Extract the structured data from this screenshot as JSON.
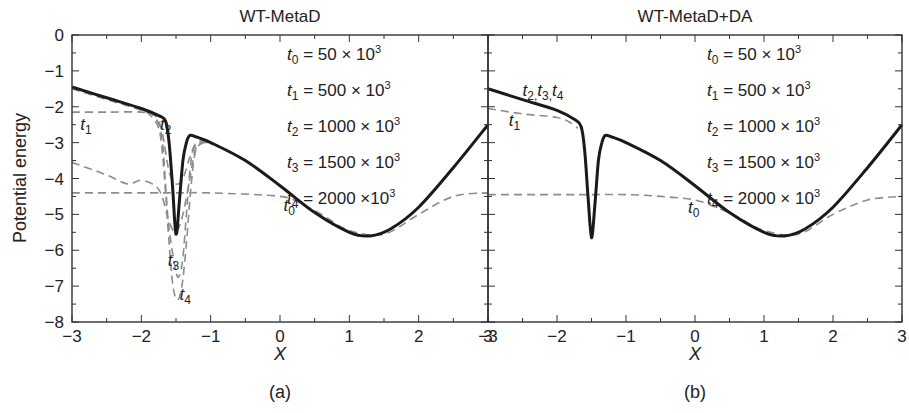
{
  "chart_data": [
    {
      "type": "line",
      "panel_label": "(a)",
      "title": "WT-MetaD",
      "xlabel": "X",
      "ylabel": "Potential energy",
      "xlim": [
        -3,
        3
      ],
      "ylim": [
        -8,
        0
      ],
      "xticks": [
        -3,
        -2,
        -1,
        0,
        1,
        2,
        3
      ],
      "yticks": [
        0,
        -1,
        -2,
        -3,
        -4,
        -5,
        -6,
        -7,
        -8
      ],
      "grid": false,
      "legend_text": [
        {
          "var": "t",
          "sub": "0",
          "expr": "= 50 × 10",
          "sup": "3"
        },
        {
          "var": "t",
          "sub": "1",
          "expr": "= 500 × 10",
          "sup": "3"
        },
        {
          "var": "t",
          "sub": "2",
          "expr": "= 1000 × 10",
          "sup": "3"
        },
        {
          "var": "t",
          "sub": "3",
          "expr": "= 1500 × 10",
          "sup": "3"
        },
        {
          "var": "t",
          "sub": "4",
          "expr": "= 2000 ×10",
          "sup": "3"
        }
      ],
      "series": [
        {
          "name": "true potential",
          "style": "solid",
          "color": "#1a1a1a",
          "x": [
            -3,
            -2.5,
            -2,
            -1.75,
            -1.65,
            -1.6,
            -1.55,
            -1.5,
            -1.45,
            -1.4,
            -1.35,
            -1.3,
            -1.2,
            -1.0,
            -0.5,
            0,
            0.5,
            1.0,
            1.3,
            1.6,
            2.0,
            2.5,
            3
          ],
          "y": [
            -1.45,
            -1.75,
            -2.05,
            -2.25,
            -2.4,
            -3.0,
            -4.2,
            -5.55,
            -4.6,
            -3.5,
            -3.0,
            -2.8,
            -2.85,
            -3.0,
            -3.5,
            -4.2,
            -4.95,
            -5.5,
            -5.6,
            -5.4,
            -4.8,
            -3.7,
            -2.5
          ]
        },
        {
          "name": "t0",
          "style": "dashed",
          "color": "#8c8c8c",
          "x": [
            -3,
            -2,
            -1.5,
            -1,
            0,
            0.3,
            0.6,
            1.0,
            1.5,
            2.0,
            2.5,
            3
          ],
          "y": [
            -4.4,
            -4.4,
            -4.4,
            -4.4,
            -4.5,
            -4.7,
            -5.0,
            -5.45,
            -5.55,
            -5.0,
            -4.5,
            -4.4
          ]
        },
        {
          "name": "t1",
          "style": "dashed",
          "color": "#8c8c8c",
          "x": [
            -3,
            -2.5,
            -2,
            -1.8,
            -1.7,
            -1.6,
            -1.5,
            -1.4,
            -1.3,
            -1.2,
            -1.0,
            -0.5,
            0,
            0.5
          ],
          "y": [
            -2.15,
            -2.15,
            -2.15,
            -2.25,
            -2.7,
            -3.8,
            -4.15,
            -4.0,
            -3.4,
            -3.0,
            -3.0,
            -3.5,
            -4.2,
            -4.95
          ]
        },
        {
          "name": "t2",
          "style": "dashed",
          "color": "#8c8c8c",
          "x": [
            -3,
            -2.5,
            -2.2,
            -2.0,
            -1.8,
            -1.7,
            -1.6,
            -1.5,
            -1.4,
            -1.3,
            -1.2,
            -1.0
          ],
          "y": [
            -3.55,
            -3.9,
            -4.15,
            -4.05,
            -4.2,
            -4.5,
            -5.2,
            -5.5,
            -5.0,
            -4.0,
            -3.1,
            -3.0
          ]
        },
        {
          "name": "t3",
          "style": "dashed",
          "color": "#8c8c8c",
          "x": [
            -3,
            -2.5,
            -2,
            -1.8,
            -1.7,
            -1.65,
            -1.6,
            -1.5,
            -1.45,
            -1.4,
            -1.35,
            -1.3,
            -1.25,
            -1.15,
            -1.0
          ],
          "y": [
            -1.5,
            -1.8,
            -2.1,
            -2.3,
            -2.9,
            -4.2,
            -5.4,
            -6.6,
            -6.7,
            -6.2,
            -5.0,
            -3.8,
            -3.2,
            -3.0,
            -3.0
          ]
        },
        {
          "name": "t4",
          "style": "dashed",
          "color": "#8c8c8c",
          "x": [
            -3,
            -2.5,
            -2,
            -1.85,
            -1.75,
            -1.7,
            -1.65,
            -1.6,
            -1.55,
            -1.5,
            -1.45,
            -1.4,
            -1.35,
            -1.3,
            -1.25,
            -1.2,
            -1.1,
            -1.0
          ],
          "y": [
            -1.48,
            -1.78,
            -2.08,
            -2.28,
            -2.6,
            -3.2,
            -4.4,
            -5.8,
            -6.9,
            -7.35,
            -7.3,
            -6.8,
            -5.8,
            -4.6,
            -3.6,
            -3.15,
            -3.0,
            -3.0
          ]
        }
      ],
      "annotations": [
        {
          "text": "t",
          "sub": "0",
          "x": 0.05,
          "y": -4.9
        },
        {
          "text": "t",
          "sub": "1",
          "x": -2.88,
          "y": -2.65
        },
        {
          "text": "t",
          "sub": "2",
          "x": -1.73,
          "y": -2.65
        },
        {
          "text": "t",
          "sub": "3",
          "x": -1.62,
          "y": -6.45
        },
        {
          "text": "t",
          "sub": "4",
          "x": -1.45,
          "y": -7.4
        }
      ]
    },
    {
      "type": "line",
      "panel_label": "(b)",
      "title": "WT-MetaD+DA",
      "xlabel": "X",
      "ylabel": "",
      "xlim": [
        -3,
        3
      ],
      "ylim": [
        -8,
        0
      ],
      "xticks": [
        -3,
        -2,
        -1,
        0,
        1,
        2,
        3
      ],
      "yticks": [
        0,
        -1,
        -2,
        -3,
        -4,
        -5,
        -6,
        -7,
        -8
      ],
      "grid": false,
      "legend_text": [
        {
          "var": "t",
          "sub": "0",
          "expr": "= 50 × 10",
          "sup": "3"
        },
        {
          "var": "t",
          "sub": "1",
          "expr": "= 500 × 10",
          "sup": "3"
        },
        {
          "var": "t",
          "sub": "2",
          "expr": "= 1000 × 10",
          "sup": "3"
        },
        {
          "var": "t",
          "sub": "3",
          "expr": "= 1500 × 10",
          "sup": "3"
        },
        {
          "var": "t",
          "sub": "4",
          "expr": "= 2000 × 10",
          "sup": "3"
        }
      ],
      "series": [
        {
          "name": "t2,t3,t4 (overlapping true potential)",
          "style": "solid",
          "color": "#1a1a1a",
          "x": [
            -3,
            -2.5,
            -2,
            -1.75,
            -1.65,
            -1.6,
            -1.55,
            -1.5,
            -1.45,
            -1.4,
            -1.35,
            -1.3,
            -1.2,
            -1.0,
            -0.5,
            0,
            0.5,
            1.0,
            1.3,
            1.6,
            2.0,
            2.5,
            3
          ],
          "y": [
            -1.5,
            -1.8,
            -2.1,
            -2.35,
            -2.55,
            -3.2,
            -4.5,
            -5.65,
            -4.7,
            -3.5,
            -3.0,
            -2.8,
            -2.85,
            -3.0,
            -3.5,
            -4.2,
            -4.95,
            -5.5,
            -5.6,
            -5.4,
            -4.8,
            -3.7,
            -2.5
          ]
        },
        {
          "name": "t0",
          "style": "dashed",
          "color": "#8c8c8c",
          "x": [
            -3,
            -2,
            -1.5,
            -1,
            -0.5,
            0,
            0.3,
            0.6,
            1.0,
            1.5,
            2.0,
            2.5,
            3
          ],
          "y": [
            -4.45,
            -4.45,
            -4.45,
            -4.45,
            -4.5,
            -4.6,
            -4.8,
            -5.05,
            -5.45,
            -5.55,
            -5.0,
            -4.6,
            -4.5
          ]
        },
        {
          "name": "t1",
          "style": "dashed",
          "color": "#8c8c8c",
          "x": [
            -3,
            -2.5,
            -2,
            -1.8,
            -1.7
          ],
          "y": [
            -2.05,
            -2.2,
            -2.3,
            -2.45,
            -2.6
          ]
        }
      ],
      "annotations": [
        {
          "text": "t2,t3,t4",
          "x": -2.5,
          "y": -1.7
        },
        {
          "text": "t",
          "sub": "1",
          "x": -2.7,
          "y": -2.55
        },
        {
          "text": "t",
          "sub": "0",
          "x": -0.1,
          "y": -4.95
        }
      ]
    }
  ],
  "styles": {
    "axis_color": "#333333",
    "solid_color": "#1a1a1a",
    "dashed_color": "#8c8c8c"
  }
}
